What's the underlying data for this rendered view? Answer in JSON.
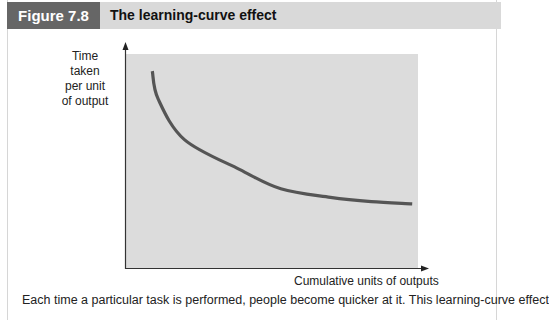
{
  "figure": {
    "label": "Figure 7.8",
    "title": "The learning-curve effect",
    "caption": "Each time a particular task is performed, people become quicker at it. This learning-curve effect"
  },
  "colors": {
    "label_bg": "#666666",
    "title_bar_bg": "#d9d9d9",
    "plot_bg": "#dcdcdc",
    "curve": "#555555",
    "axis": "#333333"
  },
  "chart_data": {
    "type": "line",
    "title": "The learning-curve effect",
    "xlabel": "Cumulative units of outputs",
    "ylabel": "Time taken per unit of output",
    "ylabel_lines": [
      "Time",
      "taken",
      "per unit",
      "of output"
    ],
    "x_ticks": [],
    "y_ticks": [],
    "grid": false,
    "legend": null,
    "series": [
      {
        "name": "Learning curve",
        "x": [
          0.09,
          0.11,
          0.2,
          0.39,
          0.53,
          0.7,
          0.84,
          0.98
        ],
        "y": [
          0.92,
          0.79,
          0.6,
          0.46,
          0.37,
          0.33,
          0.31,
          0.3
        ]
      }
    ],
    "xlim": [
      0,
      1
    ],
    "ylim": [
      0,
      1
    ],
    "note": "Qualitative curve; axes have no numeric scale"
  }
}
